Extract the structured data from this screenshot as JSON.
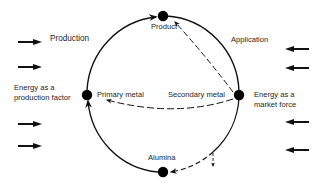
{
  "diagram": {
    "type": "cycle",
    "nodes": [
      {
        "id": "product",
        "label": "Product"
      },
      {
        "id": "primary",
        "label": "Primary metal"
      },
      {
        "id": "secondary",
        "label": "Secondary metal"
      },
      {
        "id": "alumina",
        "label": "Alumina"
      }
    ],
    "labels": {
      "production": "Production",
      "application": "Application",
      "energy_production_line1": "Energy as a",
      "energy_production_line2": "production factor",
      "energy_market_line1": "Energy as a",
      "energy_market_line2": "market force"
    },
    "edges": [
      {
        "from": "primary",
        "to": "product",
        "style": "solid",
        "arrow": true
      },
      {
        "from": "product",
        "to": "secondary",
        "style": "solid",
        "arrow": false
      },
      {
        "from": "secondary",
        "to": "alumina",
        "style": "solid-then-dashed",
        "arrow": true
      },
      {
        "from": "alumina",
        "to": "primary",
        "style": "solid",
        "arrow": true
      },
      {
        "from": "secondary",
        "to": "product",
        "style": "dashed",
        "arrow": true
      },
      {
        "from": "secondary",
        "to": "primary",
        "style": "dashed",
        "arrow": true
      },
      {
        "from": "secondary",
        "to": "loss",
        "style": "dashed",
        "arrow": true
      }
    ],
    "energy_arrows": {
      "left": {
        "direction": "right",
        "count": 4
      },
      "right": {
        "direction": "left",
        "count": 4
      }
    },
    "colors": {
      "line": "#111111",
      "node": "#000000",
      "background": "#ffffff"
    }
  }
}
